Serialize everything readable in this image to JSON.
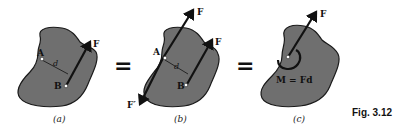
{
  "figure": {
    "label": "Fig. 3.12",
    "equals_symbol": "=",
    "panels": [
      {
        "caption": "(a)",
        "points": [
          "A",
          "B"
        ],
        "distance_label": "d",
        "forces": [
          "F"
        ]
      },
      {
        "caption": "(b)",
        "points": [
          "A",
          "B"
        ],
        "distance_label": "d",
        "forces": [
          "F",
          "F",
          "F′"
        ]
      },
      {
        "caption": "(c)",
        "forces": [
          "F"
        ],
        "moment_label": "M = Fd"
      }
    ]
  }
}
